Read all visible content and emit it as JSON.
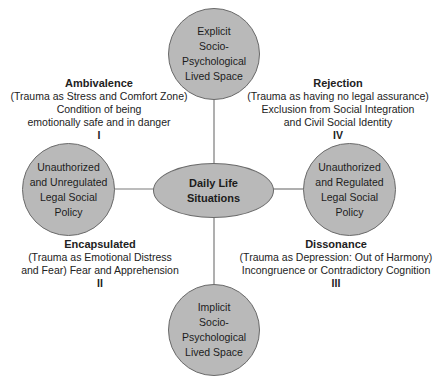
{
  "diagram": {
    "center": {
      "label": "Daily Life\nSituations"
    },
    "nodes": {
      "top": {
        "label": "Explicit\nSocio-\nPsychological\nLived Space"
      },
      "bottom": {
        "label": "Implicit\nSocio-\nPsychological\nLived Space"
      },
      "left": {
        "label": "Unauthorized\nand Unregulated\nLegal Social\nPolicy"
      },
      "right": {
        "label": "Unauthorized\nand Regulated\nLegal Social\nPolicy"
      }
    },
    "quadrants": {
      "q1": {
        "title": "Ambivalence",
        "lines": [
          "(Trauma as Stress and Comfort Zone)",
          "Condition of being",
          "emotionally safe and in danger"
        ],
        "numeral": "I"
      },
      "q2": {
        "title": "Encapsulated",
        "lines": [
          "(Trauma as Emotional Distress",
          "and Fear) Fear and Apprehension"
        ],
        "numeral": "II"
      },
      "q3": {
        "title": "Dissonance",
        "lines": [
          "(Trauma as Depression: Out of Harmony)",
          "Incongruence or Contradictory Cognition"
        ],
        "numeral": "III"
      },
      "q4": {
        "title": "Rejection",
        "lines": [
          "(Trauma as having no legal assurance)",
          "Exclusion from Social Integration",
          "and Civil Social Identity"
        ],
        "numeral": "IV"
      }
    },
    "colors": {
      "node_fill": "#b9b9b9",
      "node_stroke": "#6a6a6a",
      "line": "#7a7a7a",
      "text": "#1c1c1c"
    }
  }
}
